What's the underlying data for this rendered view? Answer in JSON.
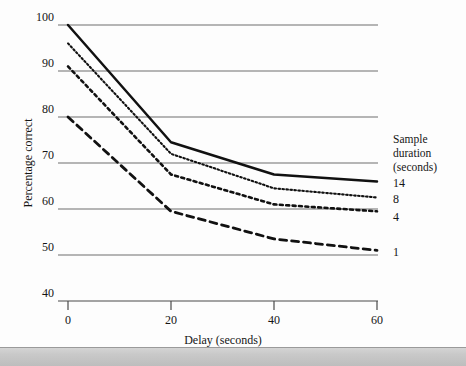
{
  "chart_data": {
    "type": "line",
    "title": "",
    "xlabel": "Delay (seconds)",
    "ylabel": "Percentage correct",
    "x": [
      0,
      20,
      40,
      60
    ],
    "xticks": [
      "0",
      "20",
      "40",
      "60"
    ],
    "yticks": [
      "100",
      "90",
      "80",
      "70",
      "60",
      "50",
      "40"
    ],
    "ytick_values": [
      100,
      90,
      80,
      70,
      60,
      50,
      40
    ],
    "xlim": [
      0,
      60
    ],
    "ylim": [
      40,
      100
    ],
    "grid": "horizontal",
    "legend_position": "right",
    "legend_title_line1": "Sample",
    "legend_title_line2": "duration",
    "legend_title_line3": "(seconds)",
    "series": [
      {
        "name": "14",
        "style": "solid",
        "values": [
          100,
          74.5,
          67.5,
          66.0
        ]
      },
      {
        "name": "8",
        "style": "fine-dotted",
        "values": [
          96.0,
          72.0,
          64.5,
          62.5
        ]
      },
      {
        "name": "4",
        "style": "dotted",
        "values": [
          91.0,
          67.5,
          61.0,
          59.5
        ]
      },
      {
        "name": "1",
        "style": "dashed",
        "values": [
          80.0,
          59.5,
          53.5,
          51.0
        ]
      }
    ]
  },
  "axes": {
    "y_title": "Percentage correct",
    "x_title": "Delay (seconds)",
    "y_labels": [
      "100",
      "90",
      "80",
      "70",
      "60",
      "50",
      "40"
    ],
    "x_labels": [
      "0",
      "20",
      "40",
      "60"
    ]
  },
  "legend": {
    "title_lines": [
      "Sample",
      "duration",
      "(seconds)"
    ],
    "entries": [
      {
        "label": "14"
      },
      {
        "label": "8"
      },
      {
        "label": "4"
      },
      {
        "label": "1"
      }
    ]
  },
  "colors": {
    "line": "#111111",
    "gridline": "#6e6e6e",
    "text": "#151515",
    "background": "#fdfdfd",
    "taskbar": "#c9c9c9"
  }
}
